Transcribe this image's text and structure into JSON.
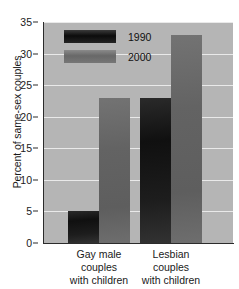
{
  "chart_data": {
    "type": "bar",
    "title": "",
    "xlabel": "",
    "ylabel": "Percent of same-sex couples",
    "ylim": [
      0,
      35
    ],
    "yticks": [
      0,
      5,
      10,
      15,
      20,
      25,
      30,
      35
    ],
    "ytick_labels": [
      "0",
      "5",
      "10",
      "15",
      "20",
      "25",
      "30",
      "35"
    ],
    "grid": true,
    "legend_position": "upper-left-inside",
    "categories": [
      "Gay male couples with children",
      "Lesbian couples with children"
    ],
    "category_lines": [
      [
        "Gay male",
        "couples",
        "with children"
      ],
      [
        "Lesbian",
        "couples",
        "with children"
      ]
    ],
    "series": [
      {
        "name": "1990",
        "values": [
          5,
          23
        ],
        "color": "#1a1a1a"
      },
      {
        "name": "2000",
        "values": [
          23,
          33
        ],
        "color": "#666666"
      }
    ],
    "plot_background": "#b5b5b5",
    "gridline_color": "#e9e9e9",
    "page_background": "#ffffff"
  },
  "legend": {
    "items": [
      {
        "label": "1990"
      },
      {
        "label": "2000"
      }
    ]
  }
}
